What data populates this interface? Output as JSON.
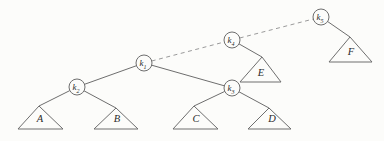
{
  "figure": {
    "background": "#fcfcfa",
    "line_color": "#6e6e6e",
    "dashed_line_color": "#9a9a9a",
    "text_color": "#2b2b2b",
    "width": 384,
    "height": 141
  },
  "diagram": {
    "nodes": [
      {
        "id": "k1",
        "label": "k",
        "subscript": "1",
        "x": 144,
        "y": 63,
        "r": 8
      },
      {
        "id": "k2",
        "label": "k",
        "subscript": "2",
        "x": 77,
        "y": 87,
        "r": 8
      },
      {
        "id": "k3",
        "label": "k",
        "subscript": "3",
        "x": 232,
        "y": 88,
        "r": 8
      },
      {
        "id": "k4",
        "label": "k",
        "subscript": "4",
        "x": 232,
        "y": 40,
        "r": 8
      },
      {
        "id": "k5",
        "label": "k",
        "subscript": "5",
        "x": 321,
        "y": 17,
        "r": 8
      }
    ],
    "subtrees": [
      {
        "id": "A",
        "label": "A",
        "apex": [
          39,
          106
        ],
        "base_left": [
          18,
          129
        ],
        "base_right": [
          63,
          129
        ],
        "label_x": 40,
        "label_y": 122
      },
      {
        "id": "B",
        "label": "B",
        "apex": [
          116,
          108
        ],
        "base_left": [
          94,
          129
        ],
        "base_right": [
          138,
          129
        ],
        "label_x": 117,
        "label_y": 122
      },
      {
        "id": "C",
        "label": "C",
        "apex": [
          194,
          106
        ],
        "base_left": [
          173,
          129
        ],
        "base_right": [
          218,
          129
        ],
        "label_x": 196,
        "label_y": 122
      },
      {
        "id": "D",
        "label": "D",
        "apex": [
          269,
          108
        ],
        "base_left": [
          248,
          129
        ],
        "base_right": [
          291,
          129
        ],
        "label_x": 272,
        "label_y": 122
      },
      {
        "id": "E",
        "label": "E",
        "apex": [
          262,
          57
        ],
        "base_left": [
          240,
          82
        ],
        "base_right": [
          281,
          82
        ],
        "label_x": 261,
        "label_y": 76
      },
      {
        "id": "F",
        "label": "F",
        "apex": [
          350,
          37
        ],
        "base_left": [
          329,
          62
        ],
        "base_right": [
          372,
          62
        ],
        "label_x": 351,
        "label_y": 55
      }
    ],
    "edges": [
      {
        "from": "k1",
        "to": "k2",
        "style": "solid"
      },
      {
        "from": "k1",
        "to": "k3",
        "style": "solid"
      },
      {
        "from": "k2",
        "to": "A",
        "style": "solid"
      },
      {
        "from": "k2",
        "to": "B",
        "style": "solid"
      },
      {
        "from": "k3",
        "to": "C",
        "style": "solid"
      },
      {
        "from": "k3",
        "to": "D",
        "style": "solid"
      },
      {
        "from": "k4",
        "to": "E",
        "style": "solid"
      },
      {
        "from": "k5",
        "to": "F",
        "style": "solid"
      },
      {
        "from": "k1",
        "to": "k4",
        "style": "dashed"
      },
      {
        "from": "k4",
        "to": "k5",
        "style": "dashed"
      }
    ]
  }
}
